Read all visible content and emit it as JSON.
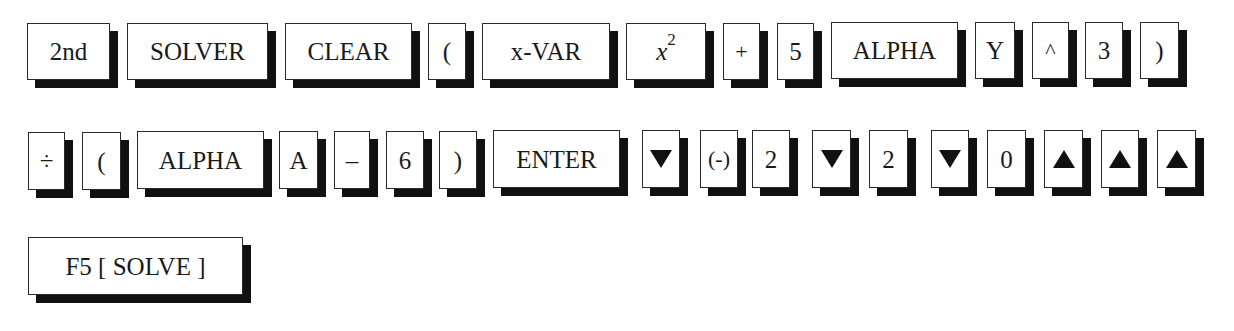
{
  "rows": [
    {
      "keys": [
        {
          "label": "2nd"
        },
        {
          "label": "SOLVER"
        },
        {
          "label": "CLEAR"
        },
        {
          "label": "("
        },
        {
          "label": "x-VAR"
        },
        {
          "label_base": "x",
          "label_sup": "2"
        },
        {
          "label": "+"
        },
        {
          "label": "5"
        },
        {
          "label": "ALPHA"
        },
        {
          "label": "Y"
        },
        {
          "label": "^"
        },
        {
          "label": "3"
        },
        {
          "label": ")"
        }
      ]
    },
    {
      "keys": [
        {
          "label": "÷"
        },
        {
          "label": "("
        },
        {
          "label": "ALPHA"
        },
        {
          "label": "A"
        },
        {
          "label": "–"
        },
        {
          "label": "6"
        },
        {
          "label": ")"
        },
        {
          "label": "ENTER"
        },
        {
          "icon": "down-arrow-icon"
        },
        {
          "label": "(-)"
        },
        {
          "label": "2"
        },
        {
          "icon": "down-arrow-icon"
        },
        {
          "label": "2"
        },
        {
          "icon": "down-arrow-icon"
        },
        {
          "label": "0"
        },
        {
          "icon": "up-arrow-icon"
        },
        {
          "icon": "up-arrow-icon"
        },
        {
          "icon": "up-arrow-icon"
        }
      ]
    },
    {
      "keys": [
        {
          "label": "F5 [ SOLVE ]"
        }
      ]
    }
  ],
  "colors": {
    "key_face": "#ffffff",
    "key_border": "#2a2a2a",
    "key_shadow": "#111111",
    "text": "#1a1a1a"
  }
}
